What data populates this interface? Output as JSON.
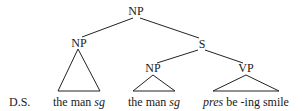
{
  "diagram": {
    "type": "syntax-tree",
    "row_label": "D.S.",
    "nodes": {
      "root": "NP",
      "left_np": "NP",
      "s": "S",
      "subj_np": "NP",
      "vp": "VP"
    },
    "leaves": {
      "left": {
        "plain": "the man ",
        "italic": "sg"
      },
      "middle": {
        "plain": "the man ",
        "italic": "sg"
      },
      "right": {
        "italic": "pres",
        "plain": " be -ing smile"
      }
    },
    "edges": [
      [
        "NP (root)",
        "NP (left)"
      ],
      [
        "NP (root)",
        "S"
      ],
      [
        "S",
        "NP (subject)"
      ],
      [
        "S",
        "VP"
      ]
    ],
    "triangles_under": [
      "NP (left)",
      "NP (subject)",
      "VP"
    ]
  }
}
